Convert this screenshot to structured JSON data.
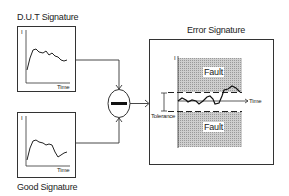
{
  "diagram": {
    "dut_title": "D.U.T Signature",
    "good_title": "Good Signature",
    "error_title": "Error Signature",
    "axis_y": "I",
    "axis_x": "Time",
    "fault_upper": "Fault",
    "fault_lower": "Fault",
    "tolerance": "Tolerance",
    "comparator_symbol": "minus"
  }
}
